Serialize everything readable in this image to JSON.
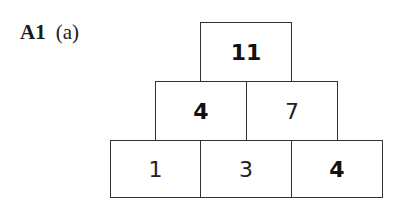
{
  "question": {
    "number": "A1",
    "part": "(a)"
  },
  "pyramid": {
    "rows": [
      [
        {
          "value": "11",
          "bold": true
        }
      ],
      [
        {
          "value": "4",
          "bold": true
        },
        {
          "value": "7",
          "bold": false
        }
      ],
      [
        {
          "value": "1",
          "bold": false
        },
        {
          "value": "3",
          "bold": false
        },
        {
          "value": "4",
          "bold": true
        }
      ]
    ]
  }
}
